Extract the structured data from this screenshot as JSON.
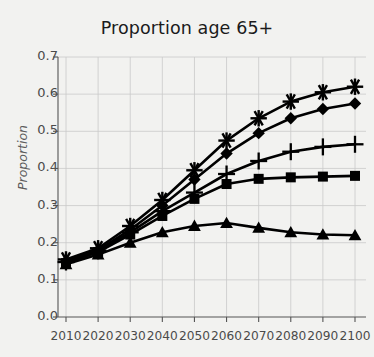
{
  "chart_data": {
    "type": "line",
    "title": "Proportion age 65+",
    "xlabel": "",
    "ylabel": "Proportion",
    "x": [
      2010,
      2020,
      2030,
      2040,
      2050,
      2060,
      2070,
      2080,
      2090,
      2100
    ],
    "xlim": [
      2005,
      2105
    ],
    "ylim": [
      0.0,
      0.7
    ],
    "ytick_labels": [
      "0.0",
      "0.1",
      "0.2",
      "0.3",
      "0.4",
      "0.5",
      "0.6",
      "0.7"
    ],
    "ytick_values": [
      0.0,
      0.1,
      0.2,
      0.3,
      0.4,
      0.5,
      0.6,
      0.7
    ],
    "xtick_labels": [
      "2010",
      "2020",
      "2030",
      "2040",
      "2050",
      "2060",
      "2070",
      "2080",
      "2090",
      "2100"
    ],
    "grid": true,
    "legend": "none",
    "series": [
      {
        "name": "series-asterisk",
        "marker": "asterisk",
        "color": "#000000",
        "values": [
          0.155,
          0.185,
          0.245,
          0.315,
          0.395,
          0.475,
          0.535,
          0.58,
          0.605,
          0.62
        ]
      },
      {
        "name": "series-diamond",
        "marker": "diamond",
        "color": "#000000",
        "values": [
          0.15,
          0.18,
          0.235,
          0.3,
          0.37,
          0.44,
          0.495,
          0.535,
          0.56,
          0.575
        ]
      },
      {
        "name": "series-plus",
        "marker": "plus",
        "color": "#000000",
        "values": [
          0.148,
          0.178,
          0.228,
          0.285,
          0.335,
          0.385,
          0.42,
          0.445,
          0.458,
          0.465
        ]
      },
      {
        "name": "series-square",
        "marker": "square",
        "color": "#000000",
        "values": [
          0.145,
          0.175,
          0.222,
          0.272,
          0.318,
          0.358,
          0.372,
          0.376,
          0.378,
          0.38
        ]
      },
      {
        "name": "series-triangle",
        "marker": "triangle",
        "color": "#000000",
        "values": [
          0.142,
          0.168,
          0.2,
          0.228,
          0.245,
          0.253,
          0.24,
          0.228,
          0.222,
          0.22
        ]
      }
    ]
  }
}
